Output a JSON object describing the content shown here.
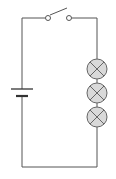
{
  "diagram": {
    "type": "circuit",
    "title": "",
    "colors": {
      "background": "#ffffff",
      "wire": "#555555",
      "lamp_fill": "#d9d9d9",
      "lamp_stroke": "#666666"
    },
    "components": [
      {
        "kind": "battery",
        "cells": 1
      },
      {
        "kind": "switch",
        "state": "open"
      },
      {
        "kind": "lamp",
        "index": 1
      },
      {
        "kind": "lamp",
        "index": 2
      },
      {
        "kind": "lamp",
        "index": 3
      }
    ],
    "connection": "series"
  }
}
